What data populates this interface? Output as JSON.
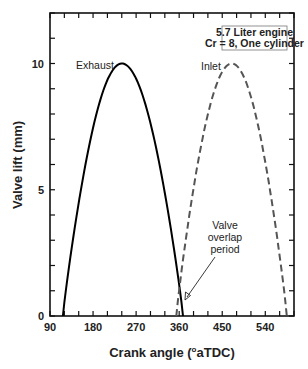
{
  "chart_data": {
    "type": "line",
    "title": "",
    "xlabel": "Crank angle (°aTDC)",
    "xlabel_prefix": "Crank angle (",
    "xlabel_degree": "o",
    "xlabel_suffix": "aTDC)",
    "ylabel": "Valve lift (mm)",
    "xlim": [
      90,
      600
    ],
    "ylim": [
      0,
      12
    ],
    "xticks": [
      90,
      180,
      270,
      360,
      450,
      540
    ],
    "yticks": [
      0,
      5,
      10
    ],
    "grid": false,
    "legend_box": {
      "line1": "5.7 Liter engine",
      "line2": "Cr = 8, One cylinder",
      "position": "upper right"
    },
    "series": [
      {
        "name": "Exhaust",
        "style": "solid",
        "color": "#000000",
        "x": [
          117,
          150,
          180,
          210,
          240,
          270,
          300,
          330,
          368
        ],
        "y": [
          0,
          5.3,
          8.5,
          9.8,
          10.0,
          9.6,
          7.9,
          5.3,
          0
        ]
      },
      {
        "name": "Inlet",
        "style": "dashed",
        "color": "#555555",
        "x": [
          354,
          390,
          420,
          450,
          470,
          500,
          530,
          560,
          585
        ],
        "y": [
          0,
          5.3,
          8.0,
          9.6,
          10.0,
          9.5,
          7.6,
          4.6,
          0
        ]
      }
    ],
    "annotations": [
      {
        "text": "Exhaust",
        "target": "exhaust curve peak"
      },
      {
        "text": "Inlet",
        "target": "inlet curve peak"
      },
      {
        "text": "Valve overlap period",
        "lines": [
          "Valve",
          "overlap",
          "period"
        ],
        "arrow_to": [
          363,
          0.7
        ]
      }
    ]
  }
}
